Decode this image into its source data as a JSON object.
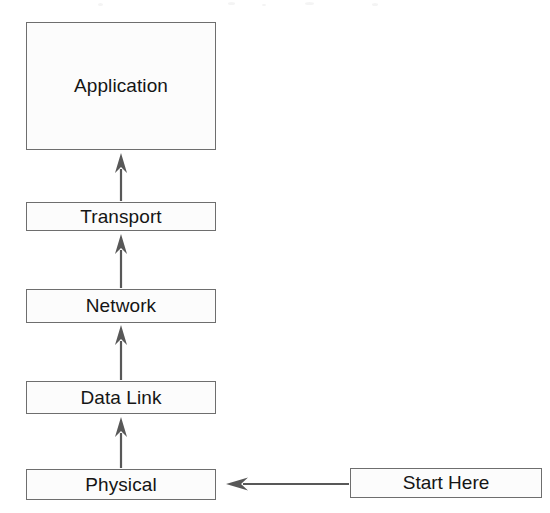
{
  "diagram": {
    "type": "flow-diagram",
    "background_color": "#ffffff",
    "stroke_color": "#6e6e6e",
    "arrow_color": "#585858",
    "text_color": "#151515",
    "box_fill": "#fcfcfc",
    "layers": [
      {
        "id": "application",
        "label": "Application",
        "x": 26,
        "y": 22,
        "width": 190,
        "height": 128
      },
      {
        "id": "transport",
        "label": "Transport",
        "x": 26,
        "y": 202,
        "width": 190,
        "height": 29
      },
      {
        "id": "network",
        "label": "Network",
        "x": 26,
        "y": 289,
        "width": 190,
        "height": 34
      },
      {
        "id": "data-link",
        "label": "Data Link",
        "x": 26,
        "y": 381,
        "width": 190,
        "height": 33
      },
      {
        "id": "physical",
        "label": "Physical",
        "x": 26,
        "y": 469,
        "width": 190,
        "height": 31
      }
    ],
    "entry_point": {
      "id": "start-here",
      "label": "Start Here",
      "x": 350,
      "y": 468,
      "width": 192,
      "height": 30
    },
    "arrows": [
      {
        "id": "arrow-transport-to-application",
        "direction": "up",
        "from": "transport",
        "to": "application",
        "x": 121,
        "y_start": 201,
        "y_end": 153
      },
      {
        "id": "arrow-network-to-transport",
        "direction": "up",
        "from": "network",
        "to": "transport",
        "x": 121,
        "y_start": 288,
        "y_end": 234
      },
      {
        "id": "arrow-datalink-to-network",
        "direction": "up",
        "from": "data-link",
        "to": "network",
        "x": 121,
        "y_start": 380,
        "y_end": 325
      },
      {
        "id": "arrow-physical-to-datalink",
        "direction": "up",
        "from": "physical",
        "to": "data-link",
        "x": 121,
        "y_start": 468,
        "y_end": 417
      },
      {
        "id": "arrow-start-to-physical",
        "direction": "left",
        "from": "start-here",
        "to": "physical",
        "y": 484,
        "x_start": 349,
        "x_end": 226
      }
    ]
  }
}
